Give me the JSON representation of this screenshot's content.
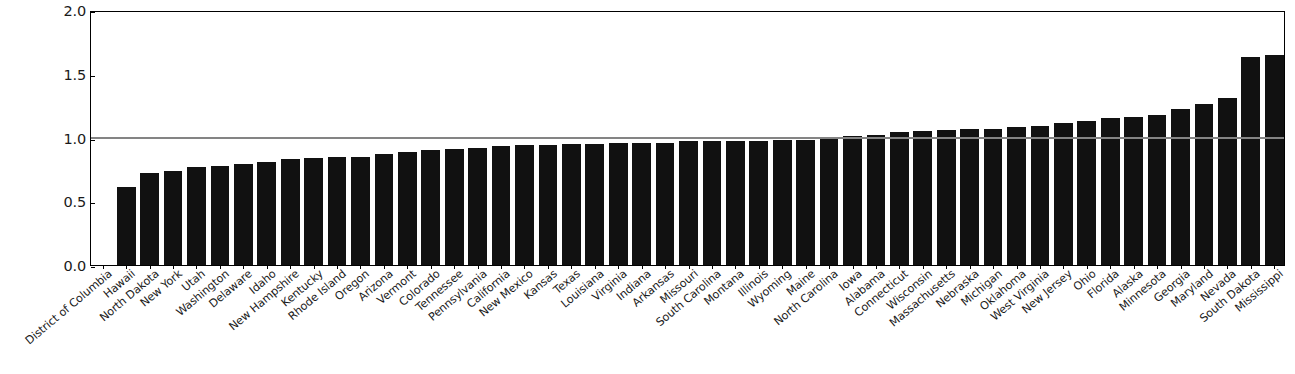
{
  "chart": {
    "type": "bar",
    "title": "",
    "xlabel": "",
    "ylabel": "",
    "ylim": [
      0.0,
      2.0
    ],
    "yticks": [
      "0.0",
      "0.5",
      "1.0",
      "1.5",
      "2.0"
    ],
    "ytick_values": [
      0.0,
      0.5,
      1.0,
      1.5,
      2.0
    ],
    "grid": false,
    "legend": null,
    "bar_color": "#111111",
    "reference_line": {
      "value": 1.0,
      "color": "#848484",
      "label": ""
    }
  },
  "chart_data": {
    "type": "bar",
    "title": "",
    "xlabel": "",
    "ylabel": "",
    "ylim": [
      0.0,
      2.0
    ],
    "yticks": [
      0.0,
      0.5,
      1.0,
      1.5,
      2.0
    ],
    "grid": false,
    "legend_position": "none",
    "reference_line": 1.0,
    "categories": [
      "District of Columbia",
      "Hawaii",
      "North Dakota",
      "New York",
      "Utah",
      "Washington",
      "Delaware",
      "Idaho",
      "New Hampshire",
      "Kentucky",
      "Rhode Island",
      "Oregon",
      "Arizona",
      "Vermont",
      "Colorado",
      "Tennessee",
      "Pennsylvania",
      "California",
      "New Mexico",
      "Kansas",
      "Texas",
      "Louisiana",
      "Virginia",
      "Indiana",
      "Arkansas",
      "Missouri",
      "South Carolina",
      "Montana",
      "Illinois",
      "Wyoming",
      "Maine",
      "North Carolina",
      "Iowa",
      "Alabama",
      "Connecticut",
      "Wisconsin",
      "Massachusetts",
      "Nebraska",
      "Michigan",
      "Oklahoma",
      "West Virginia",
      "New Jersey",
      "Ohio",
      "Florida",
      "Alaska",
      "Minnesota",
      "Georgia",
      "Maryland",
      "Nevada",
      "South Dakota",
      "Mississippi"
    ],
    "values": [
      0.0,
      0.61,
      0.72,
      0.74,
      0.77,
      0.78,
      0.79,
      0.81,
      0.83,
      0.84,
      0.85,
      0.85,
      0.87,
      0.89,
      0.9,
      0.91,
      0.92,
      0.93,
      0.94,
      0.94,
      0.95,
      0.95,
      0.96,
      0.96,
      0.96,
      0.97,
      0.97,
      0.97,
      0.97,
      0.98,
      0.98,
      0.99,
      1.01,
      1.02,
      1.04,
      1.05,
      1.06,
      1.07,
      1.07,
      1.08,
      1.09,
      1.11,
      1.13,
      1.15,
      1.16,
      1.18,
      1.22,
      1.26,
      1.31,
      1.63,
      1.65
    ]
  }
}
